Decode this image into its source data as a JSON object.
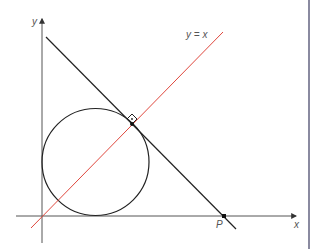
{
  "diagram": {
    "labels": {
      "y_axis": "y",
      "x_axis": "x",
      "line_label": "y = x",
      "point_p": "P"
    },
    "colors": {
      "axis": "#555555",
      "line": "#222222",
      "circle": "#222222",
      "diagonal": "#e0483e",
      "frame": "#8a8aa0"
    },
    "elements": [
      "x-axis",
      "y-axis",
      "circle tangent to both axes",
      "line y = x",
      "tangent line through P perpendicular to y = x",
      "right-angle marker at tangent point",
      "point P on x-axis"
    ]
  }
}
